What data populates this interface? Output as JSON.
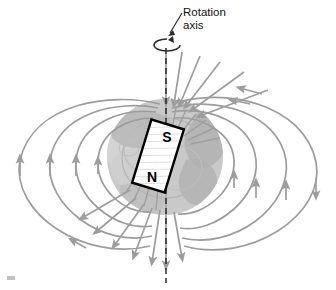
{
  "figure": {
    "kind": "earth-magnetic-dipole-diagram",
    "title_label_line1": "Rotation",
    "title_label_line2": "axis",
    "magnet": {
      "south_pole_label": "S",
      "north_pole_label": "N",
      "tilt_degrees": 17,
      "center_x": 158,
      "center_y": 156,
      "width": 34,
      "height": 66
    },
    "earth": {
      "center_x": 165,
      "center_y": 157,
      "radius": 58,
      "surface_color": "#c9c9c9",
      "continent_color": "#b0b0b0",
      "inner_color": "#d6d6d6"
    },
    "rotation_axis": {
      "x": 166,
      "top_y": 48,
      "bottom_y": 283,
      "style": "dashed",
      "color": "#2b2b2b"
    },
    "rotation_arrow": {
      "center_x": 167,
      "center_y": 45,
      "rx": 13,
      "ry": 6
    },
    "leader_line": {
      "from_x": 181,
      "from_y": 14,
      "to_x": 170,
      "to_y": 33
    },
    "field_lines": {
      "color": "#9d9d9d",
      "stroke_width": 1.7,
      "loop_count_per_side": 4,
      "polar_ray_count": 16,
      "arrow_direction_top": "into-north-pole",
      "arrow_direction_bottom": "out-of-south-pole",
      "arrow_direction_left": "upward",
      "arrow_direction_right": "downward-then-up"
    }
  },
  "colors": {
    "background": "#ffffff",
    "field_line": "#9d9d9d",
    "magnet_outline": "#000000",
    "text": "#111111"
  }
}
